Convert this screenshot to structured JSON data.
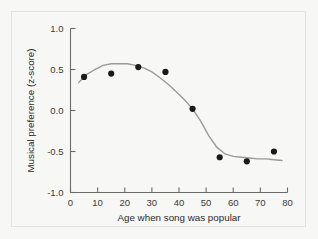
{
  "figure": {
    "background_color": "#f7f7f5",
    "border_color": "#e3e3e1",
    "axis_color": "#6b6b6b",
    "point_color": "#1a1a1a",
    "curve_color": "#9a9a9a"
  },
  "chart_data": {
    "type": "scatter",
    "title": "",
    "xlabel": "Age when song was popular",
    "ylabel": "Musical preference (z-score)",
    "xlim": [
      0,
      80
    ],
    "ylim": [
      -1.0,
      1.0
    ],
    "xticks": [
      0,
      10,
      20,
      30,
      40,
      50,
      60,
      70,
      80
    ],
    "xtick_labels": [
      "0",
      "10",
      "20",
      "30",
      "40",
      "50",
      "60",
      "70",
      "80"
    ],
    "yticks": [
      1.0,
      0.5,
      0.0,
      -0.5,
      -1.0
    ],
    "ytick_labels": [
      "1.0",
      "0.5",
      "0.0",
      "-0.5",
      "-1.0"
    ],
    "grid": false,
    "legend": null,
    "x": [
      5,
      15,
      25,
      35,
      45,
      55,
      65,
      75
    ],
    "y": [
      0.41,
      0.45,
      0.53,
      0.47,
      0.02,
      -0.57,
      -0.62,
      -0.5
    ],
    "series": [
      {
        "name": "Mean musical preference",
        "marker": "circle",
        "values": [
          0.41,
          0.45,
          0.53,
          0.47,
          0.02,
          -0.57,
          -0.62,
          -0.5
        ]
      }
    ],
    "fit_curve": {
      "name": "Fitted trend",
      "x": [
        3,
        6,
        9,
        12,
        15,
        18,
        21,
        24,
        27,
        30,
        33,
        36,
        39,
        42,
        45,
        48,
        51,
        54,
        57,
        60,
        63,
        66,
        69,
        72,
        75,
        78
      ],
      "y": [
        0.34,
        0.44,
        0.5,
        0.55,
        0.57,
        0.57,
        0.57,
        0.55,
        0.52,
        0.47,
        0.4,
        0.32,
        0.23,
        0.13,
        0.02,
        -0.13,
        -0.31,
        -0.45,
        -0.53,
        -0.56,
        -0.57,
        -0.58,
        -0.59,
        -0.59,
        -0.6,
        -0.61
      ]
    }
  }
}
